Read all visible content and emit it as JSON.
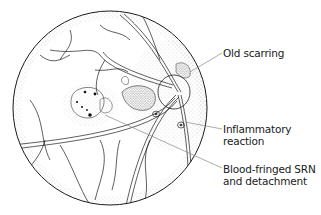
{
  "figure": {
    "labels": [
      {
        "id": "old-scarring",
        "lines": [
          "Old scarring"
        ]
      },
      {
        "id": "inflammatory-reaction",
        "lines": [
          "Inflammatory",
          "reaction"
        ]
      },
      {
        "id": "blood-fringed-srn",
        "lines": [
          "Blood-fringed SRN",
          "and detachment"
        ]
      }
    ]
  },
  "colors": {
    "ink": "#1a1a1a",
    "leader": "#888888",
    "background": "#ffffff"
  }
}
